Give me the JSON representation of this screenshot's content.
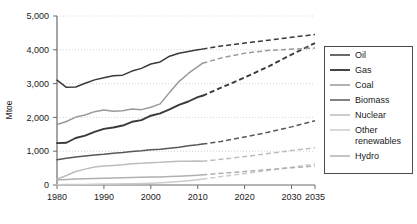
{
  "chart_data": {
    "type": "line",
    "title": "",
    "subtitle": "",
    "xlabel": "",
    "ylabel": "Mtoe",
    "xlim": [
      1980,
      2035
    ],
    "ylim": [
      0,
      5000
    ],
    "grid": true,
    "grid_axis": "y",
    "legend_position": "right",
    "history_end": 2011,
    "annotations": [],
    "xticks": [
      1980,
      1990,
      2000,
      2010,
      2020,
      2030,
      2035
    ],
    "xtick_labels": [
      "1980",
      "1990",
      "2000",
      "2010",
      "2020",
      "2030",
      "2035"
    ],
    "yticks": [
      0,
      1000,
      2000,
      3000,
      4000,
      5000
    ],
    "ytick_labels": [
      "0",
      "1,000",
      "2,000",
      "3,000",
      "4,000",
      "5,000"
    ],
    "x": [
      1980,
      1982,
      1984,
      1986,
      1988,
      1990,
      1992,
      1994,
      1996,
      1998,
      2000,
      2002,
      2004,
      2006,
      2008,
      2010,
      2011,
      2015,
      2020,
      2025,
      2030,
      2035
    ],
    "series": [
      {
        "name": "Oil",
        "color": "#3a3a3a",
        "width": 1.5,
        "values": [
          3100,
          2890,
          2900,
          3010,
          3110,
          3170,
          3230,
          3250,
          3370,
          3450,
          3580,
          3640,
          3810,
          3900,
          3950,
          4000,
          4020,
          4110,
          4200,
          4280,
          4370,
          4450
        ]
      },
      {
        "name": "Gas",
        "color": "#3a3a3a",
        "width": 1.9,
        "values": [
          1240,
          1250,
          1390,
          1460,
          1570,
          1660,
          1700,
          1760,
          1870,
          1920,
          2050,
          2120,
          2240,
          2370,
          2470,
          2600,
          2640,
          2880,
          3180,
          3500,
          3860,
          4200
        ]
      },
      {
        "name": "Coal",
        "color": "#9a9a9a",
        "width": 1.5,
        "values": [
          1790,
          1880,
          2010,
          2070,
          2170,
          2220,
          2180,
          2200,
          2250,
          2230,
          2300,
          2400,
          2740,
          3060,
          3300,
          3500,
          3600,
          3760,
          3900,
          3980,
          4020,
          4050
        ]
      },
      {
        "name": "Biomass",
        "color": "#585858",
        "width": 1.5,
        "values": [
          750,
          790,
          830,
          860,
          890,
          910,
          940,
          960,
          990,
          1010,
          1040,
          1060,
          1090,
          1120,
          1160,
          1190,
          1210,
          1290,
          1420,
          1560,
          1720,
          1900
        ]
      },
      {
        "name": "Nuclear",
        "color": "#bdbdbd",
        "width": 1.5,
        "values": [
          170,
          280,
          400,
          470,
          530,
          560,
          580,
          600,
          630,
          640,
          660,
          670,
          690,
          700,
          700,
          710,
          700,
          760,
          840,
          930,
          1020,
          1100
        ]
      },
      {
        "name": "Other renewables",
        "color": "#cccccc",
        "width": 1.5,
        "values": [
          10,
          12,
          15,
          18,
          22,
          26,
          30,
          34,
          40,
          46,
          55,
          65,
          80,
          100,
          125,
          155,
          170,
          250,
          340,
          430,
          525,
          620
        ]
      },
      {
        "name": "Hydro",
        "color": "#b0b0b0",
        "width": 1.5,
        "values": [
          150,
          160,
          175,
          185,
          195,
          200,
          205,
          215,
          225,
          230,
          235,
          240,
          250,
          260,
          275,
          290,
          300,
          345,
          400,
          455,
          510,
          560
        ]
      }
    ]
  },
  "legend": {
    "items": [
      {
        "label": "Oil"
      },
      {
        "label": "Gas"
      },
      {
        "label": "Coal"
      },
      {
        "label": "Biomass"
      },
      {
        "label": "Nuclear"
      },
      {
        "label": "Other"
      },
      {
        "label": "renewables"
      },
      {
        "label": "Hydro"
      }
    ]
  }
}
